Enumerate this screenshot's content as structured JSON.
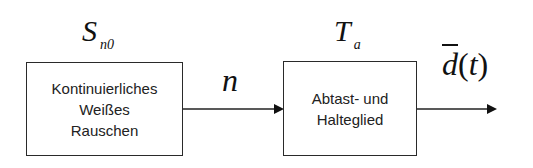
{
  "diagram": {
    "type": "block-diagram",
    "blocks": [
      {
        "id": "noise-source",
        "lines": [
          "Kontinuierliches",
          "Weißes",
          "Rauschen"
        ],
        "parameter": {
          "symbol": "S",
          "subscript": "n0"
        }
      },
      {
        "id": "sample-and-hold",
        "lines": [
          "Abtast- und",
          "Halteglied"
        ],
        "parameter": {
          "symbol": "T",
          "subscript": "a"
        }
      }
    ],
    "connections": [
      {
        "from": "noise-source",
        "to": "sample-and-hold",
        "label": "n"
      },
      {
        "from": "sample-and-hold",
        "to": "output",
        "label": {
          "symbol": "d",
          "overline": true,
          "argument": "(t)"
        }
      }
    ],
    "colors": {
      "stroke": "#222222",
      "background": "#ffffff"
    }
  }
}
